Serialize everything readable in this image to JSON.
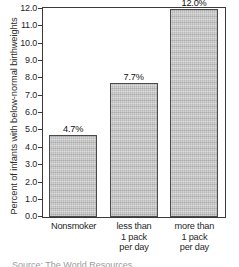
{
  "chart_data": {
    "type": "bar",
    "title": "",
    "xlabel": "",
    "ylabel": "Percent of infants with below-normal birthweights",
    "categories": [
      "Nonsmoker",
      "less than 1 pack per day",
      "more than 1 pack per day"
    ],
    "category_lines": [
      [
        "Nonsmoker"
      ],
      [
        "less than",
        "1 pack",
        "per day"
      ],
      [
        "more than",
        "1 pack",
        "per day"
      ]
    ],
    "values": [
      4.7,
      7.7,
      12.0
    ],
    "value_labels": [
      "4.7%",
      "7.7%",
      "12.0%"
    ],
    "ylim": [
      0.0,
      12.0
    ],
    "ytick_step": 1.0,
    "ytick_labels": [
      "12.0",
      "11.0",
      "10.0",
      "9.0",
      "8.0",
      "7.0",
      "6.0",
      "5.0",
      "4.0",
      "3.0",
      "2.0",
      "1.0",
      "0.0"
    ],
    "ytick_values": [
      12.0,
      11.0,
      10.0,
      9.0,
      8.0,
      7.0,
      6.0,
      5.0,
      4.0,
      3.0,
      2.0,
      1.0,
      0.0
    ],
    "grid": false,
    "legend": false,
    "bar_fill_color": "#b2b2b2",
    "bar_edge_color": "#4a4a4a",
    "frame_color": "#3a3a3a"
  },
  "caption": {
    "partial_text": "Source: The World Resources"
  }
}
